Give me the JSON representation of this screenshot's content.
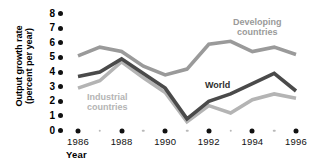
{
  "chart_data": {
    "type": "line",
    "title": "",
    "xlabel": "Year",
    "ylabel": "Output growth rate (percent per year)",
    "ylabel_line1": "Output growth rate",
    "ylabel_line2": "(percent per year)",
    "x": [
      1986,
      1987,
      1988,
      1989,
      1990,
      1991,
      1992,
      1993,
      1994,
      1995,
      1996
    ],
    "categories": [
      "1986",
      "1987",
      "1988",
      "1989",
      "1990",
      "1991",
      "1992",
      "1993",
      "1994",
      "1995",
      "1996"
    ],
    "xticks": [
      "1986",
      "1988",
      "1990",
      "1992",
      "1994",
      "1996"
    ],
    "xtick_values": [
      1986,
      1988,
      1990,
      1992,
      1994,
      1996
    ],
    "yticks": [
      "0",
      "1",
      "2",
      "3",
      "4",
      "5",
      "6",
      "7",
      "8"
    ],
    "ytick_values": [
      0,
      1,
      2,
      3,
      4,
      5,
      6,
      7,
      8
    ],
    "ylim": [
      0,
      8
    ],
    "xlim": [
      1986,
      1996
    ],
    "grid": false,
    "legend_position": "inline-annotations",
    "series": [
      {
        "name": "Developing countries",
        "color": "#9a9a9a",
        "values": [
          5.1,
          5.7,
          5.4,
          4.4,
          3.8,
          4.2,
          5.9,
          6.1,
          5.4,
          5.7,
          5.2
        ]
      },
      {
        "name": "World",
        "color": "#4a4a4a",
        "values": [
          3.7,
          4.0,
          4.9,
          3.9,
          2.9,
          0.8,
          2.0,
          2.5,
          3.2,
          3.9,
          2.7
        ]
      },
      {
        "name": "Industrial countries",
        "color": "#b4b4b4",
        "values": [
          2.9,
          3.4,
          4.7,
          3.6,
          2.6,
          0.6,
          1.7,
          1.2,
          2.1,
          2.5,
          2.2
        ]
      }
    ],
    "annotations": [
      {
        "text_line1": "Developing",
        "text_line2": "countries",
        "series": "Developing countries"
      },
      {
        "text_line1": "Industrial",
        "text_line2": "countries",
        "series": "Industrial countries"
      },
      {
        "text_line1": "World",
        "text_line2": "",
        "series": "World"
      }
    ]
  },
  "labels": {
    "developing_l1": "Developing",
    "developing_l2": "countries",
    "industrial_l1": "Industrial",
    "industrial_l2": "countries",
    "world": "World",
    "year_axis": "Year",
    "y_axis_l1": "Output growth rate",
    "y_axis_l2": "(percent per year)"
  },
  "colors": {
    "developing": "#9a9a9a",
    "world": "#4a4a4a",
    "industrial": "#b4b4b4",
    "axis_dot": "#111111",
    "minor_dot": "#b9b9b9",
    "background": "#ffffff"
  }
}
